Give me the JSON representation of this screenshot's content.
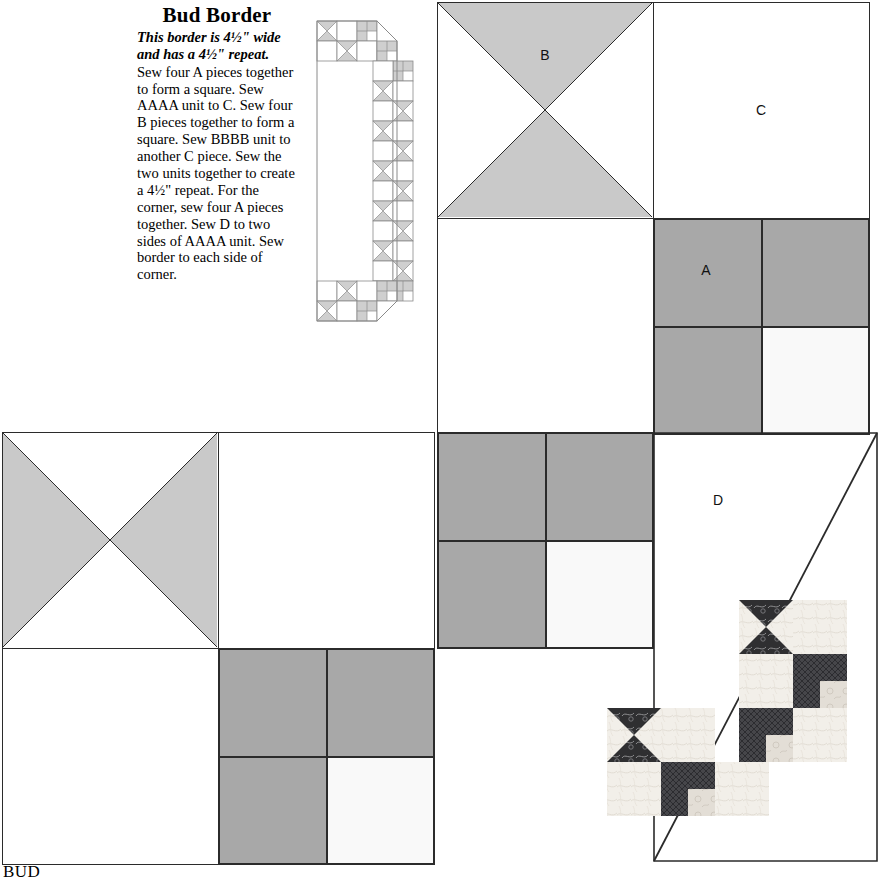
{
  "document": {
    "pattern_title": "Bud Border",
    "intro_text": "This border is 4½\" wide and has a 4½\" repeat.",
    "body_text": "Sew four A pieces together to form a square. Sew AAAA unit to C. Sew four B pieces together to form a square. Sew BBBB unit to another C piece. Sew the two units together to create a 4½\" repeat. For the corner, sew four A pieces together. Sew D to two sides of AAAA unit. Sew border to each side of corner.",
    "caption": "BUD"
  },
  "labels": {
    "piece_a": "A",
    "piece_b": "B",
    "piece_c": "C",
    "piece_d": "D"
  },
  "colors": {
    "shade_medium": "#a8a8a8",
    "shade_light": "#d4d4d4",
    "shade_white": "#ffffff",
    "shade_offwhite": "#f7f7f7",
    "line": "#2b2b2b",
    "photo_dark": "#2e2e30",
    "photo_mid": "#4a4a4c",
    "photo_cream": "#f0ece6",
    "photo_light": "#dedad4"
  },
  "diagram": {
    "blocks": [
      {
        "name": "block-b-hourglass",
        "type": "hourglass",
        "label": "B",
        "orientation": "vertical",
        "x": 437,
        "y": 2,
        "size": 216
      },
      {
        "name": "block-c-square-top",
        "type": "plain",
        "label": "C",
        "x": 653,
        "y": 2,
        "size": 216
      },
      {
        "name": "block-plain-middle",
        "type": "plain",
        "label": "",
        "x": 437,
        "y": 218,
        "size": 216
      },
      {
        "name": "block-a-fourpatch-topright",
        "type": "fourpatch",
        "label": "A",
        "x": 653,
        "y": 218,
        "size": 216
      },
      {
        "name": "block-hourglass-left",
        "type": "hourglass",
        "label": "",
        "orientation": "horizontal",
        "x": 2,
        "y": 432,
        "size": 216
      },
      {
        "name": "block-c-square-left",
        "type": "plain",
        "label": "",
        "x": 218,
        "y": 432,
        "size": 216
      },
      {
        "name": "block-fourpatch-center",
        "type": "fourpatch",
        "label": "",
        "x": 437,
        "y": 432,
        "size": 216
      },
      {
        "name": "block-plain-bottomleft",
        "type": "plain",
        "label": "",
        "x": 2,
        "y": 648,
        "size": 216
      },
      {
        "name": "block-fourpatch-bottom",
        "type": "fourpatch",
        "label": "",
        "x": 218,
        "y": 648,
        "size": 216
      }
    ],
    "corner_triangle": {
      "name": "piece-d-triangle",
      "label": "D",
      "x": 653,
      "y": 432,
      "width": 224,
      "height": 428,
      "label_x": 718,
      "label_y": 500
    },
    "fourpatch_layout": [
      "medium",
      "medium",
      "medium",
      "offwhite"
    ],
    "hourglass_vertical_shaded": [
      "top",
      "bottom"
    ],
    "hourglass_horizontal_shaded": [
      "left",
      "right"
    ]
  },
  "border_strip": {
    "name": "border-strip-schematic",
    "description": "L-shaped border strip of alternating hourglass and four-patch units"
  },
  "fabric_photo": {
    "name": "fabric-sample-photo",
    "description": "Photographed quilt blocks showing dark floral hourglass and four-patch units on cream background"
  }
}
